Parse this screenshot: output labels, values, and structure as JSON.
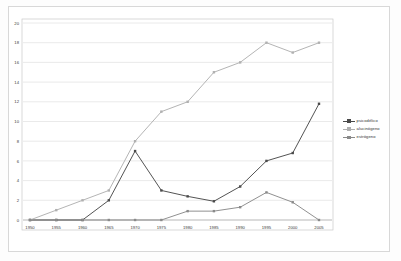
{
  "chart_data": {
    "type": "line",
    "title": "",
    "subtitle": "",
    "xlabel": "",
    "ylabel": "",
    "categories": [
      "1950",
      "1955",
      "1960",
      "1965",
      "1970",
      "1975",
      "1980",
      "1985",
      "1990",
      "1995",
      "2000",
      "2005"
    ],
    "x": [
      1950,
      1955,
      1960,
      1965,
      1970,
      1975,
      1980,
      1985,
      1990,
      1995,
      2000,
      2005
    ],
    "xlim": [
      1950,
      2005
    ],
    "ylim": [
      0,
      20
    ],
    "ytick_values": [
      0,
      2,
      4,
      6,
      8,
      10,
      12,
      14,
      16,
      18,
      20
    ],
    "ytick_labels": [
      "0",
      "2",
      "4",
      "6",
      "8",
      "10",
      "12",
      "14",
      "16",
      "18",
      "20"
    ],
    "grid": "horizontal",
    "legend_position": "right",
    "series": [
      {
        "name": "psicodélico",
        "color": "#4a4a4a",
        "marker": "square",
        "values": [
          0,
          0,
          0,
          2,
          7,
          3,
          2.4,
          1.9,
          3.4,
          6,
          6.8,
          11.8
        ]
      },
      {
        "name": "alucinógeno",
        "color": "#b0b0b0",
        "marker": "square",
        "values": [
          0,
          1,
          2,
          3,
          8,
          11,
          12,
          15,
          16,
          18,
          17,
          18
        ]
      },
      {
        "name": "estrógeno",
        "color": "#8a8a8a",
        "marker": "square",
        "values": [
          0,
          0,
          0,
          0,
          0,
          0,
          0.9,
          0.9,
          1.3,
          2.8,
          1.8,
          0
        ]
      }
    ]
  },
  "legend": {
    "items": [
      {
        "label": "psicodélico"
      },
      {
        "label": "alucinógeno"
      },
      {
        "label": "estrógeno"
      }
    ]
  },
  "colors": {
    "series_1": "#4a4a4a",
    "series_2": "#b0b0b0",
    "series_3": "#8a8a8a",
    "grid": "#d9d9d9",
    "axis": "#9a9a9a",
    "frame": "#d8d8d8",
    "text": "#3a3a3a",
    "background": "#ffffff"
  }
}
